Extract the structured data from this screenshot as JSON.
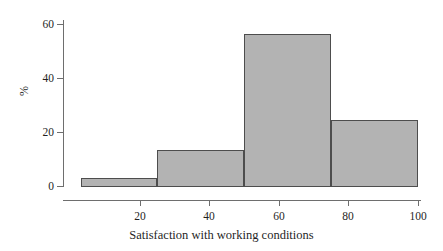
{
  "chart_data": {
    "type": "bar",
    "title": "",
    "subtitle": "",
    "xlabel": "Satisfaction with working conditions",
    "ylabel": "%",
    "xlim": [
      3,
      100
    ],
    "ylim": [
      0,
      61
    ],
    "grid": false,
    "legend": "none",
    "bin_edges": [
      3,
      25,
      50,
      75,
      100
    ],
    "bin_labels": [
      "3-25",
      "25-50",
      "50-75",
      "75-100"
    ],
    "categories": [
      "3-25",
      "25-50",
      "50-75",
      "75-100"
    ],
    "values": [
      3.2,
      13.8,
      56.5,
      24.5
    ],
    "x_ticks": [
      20,
      40,
      60,
      80,
      100
    ],
    "x_tick_labels": [
      "20",
      "40",
      "60",
      "80",
      "100"
    ],
    "y_ticks": [
      0,
      20,
      40,
      60
    ],
    "y_tick_labels": [
      "0",
      "20",
      "40",
      "60"
    ],
    "bar_fill_color": "#b3b3b3",
    "bar_edge_color": "#4d4d4d",
    "axis_color": "#6e6e6e",
    "background_color": "#ffffff"
  }
}
